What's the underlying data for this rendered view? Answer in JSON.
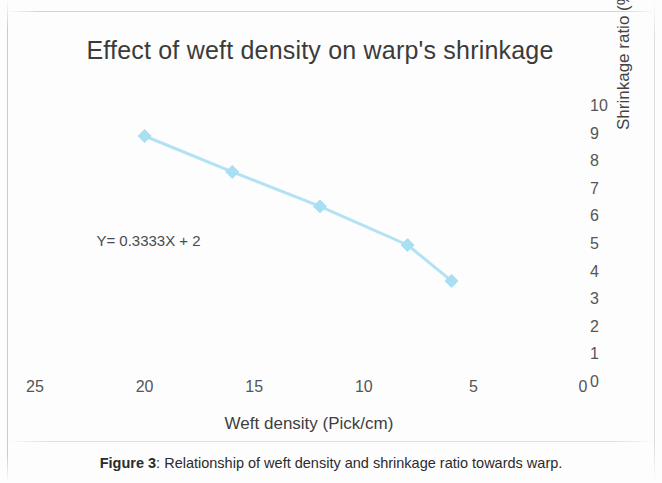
{
  "figure": {
    "caption_label": "Figure 3",
    "caption_separator": ": ",
    "caption_text": "Relationship of weft density and shrinkage ratio towards warp."
  },
  "chart_data": {
    "type": "line",
    "title": "Effect of weft density on warp's shrinkage",
    "xlabel": "Weft density (Pick/cm)",
    "ylabel": "Shrinkage ratio (%)",
    "xlim": [
      25,
      0
    ],
    "ylim": [
      0,
      10
    ],
    "x_reversed": true,
    "grid": false,
    "legend": "none",
    "y_axis_position": "right",
    "xticks": [
      25,
      20,
      15,
      10,
      5,
      0
    ],
    "yticks": [
      10,
      9,
      8,
      7,
      6,
      5,
      4,
      3,
      2,
      1,
      0
    ],
    "x": [
      20,
      16,
      12,
      8,
      6
    ],
    "values": [
      8.55,
      7.25,
      6.0,
      4.6,
      3.3
    ],
    "series": [
      {
        "name": "warp shrinkage",
        "x": [
          20,
          16,
          12,
          8,
          6
        ],
        "values": [
          8.55,
          7.25,
          6.0,
          4.6,
          3.3
        ],
        "color": "#b2e2f4",
        "marker": "diamond"
      }
    ],
    "annotations": [
      {
        "text": "Y= 0.3333X + 2",
        "x": 22.2,
        "y": 4.75
      }
    ],
    "colors": {
      "line": "#b2e2f4",
      "marker": "#a8dff2",
      "title_text": "#3b3b3b",
      "tick_text": "#555555",
      "axis_title_text": "#444444",
      "background": "#fdfdfd"
    }
  }
}
